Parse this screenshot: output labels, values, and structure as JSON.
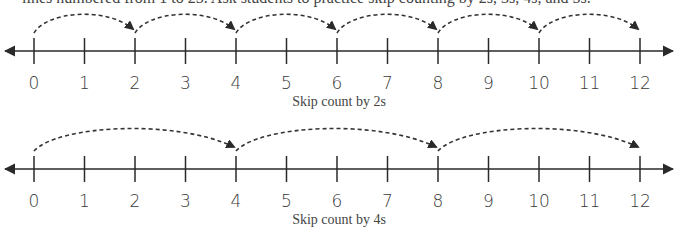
{
  "intro": {
    "text": "lines numbered from 1 to 25. Ask students to practice skip counting by 2s, 3s, 4s, and 5s."
  },
  "colors": {
    "line": "#2a2a2a",
    "text": "#3a3a3a"
  },
  "number_lines": [
    {
      "id": "skip-2",
      "caption": "Skip count by 2s",
      "axis_y": 51,
      "labels": [
        "0",
        "1",
        "2",
        "3",
        "4",
        "5",
        "6",
        "7",
        "8",
        "9",
        "10",
        "11",
        "12"
      ],
      "step": 2,
      "jumps": [
        [
          0,
          2
        ],
        [
          2,
          4
        ],
        [
          4,
          6
        ],
        [
          6,
          8
        ],
        [
          8,
          10
        ],
        [
          10,
          12
        ]
      ]
    },
    {
      "id": "skip-4",
      "caption": "Skip count by 4s",
      "axis_y": 169,
      "labels": [
        "0",
        "1",
        "2",
        "3",
        "4",
        "5",
        "6",
        "7",
        "8",
        "9",
        "10",
        "11",
        "12"
      ],
      "step": 4,
      "jumps": [
        [
          0,
          4
        ],
        [
          4,
          8
        ],
        [
          8,
          12
        ]
      ]
    }
  ]
}
